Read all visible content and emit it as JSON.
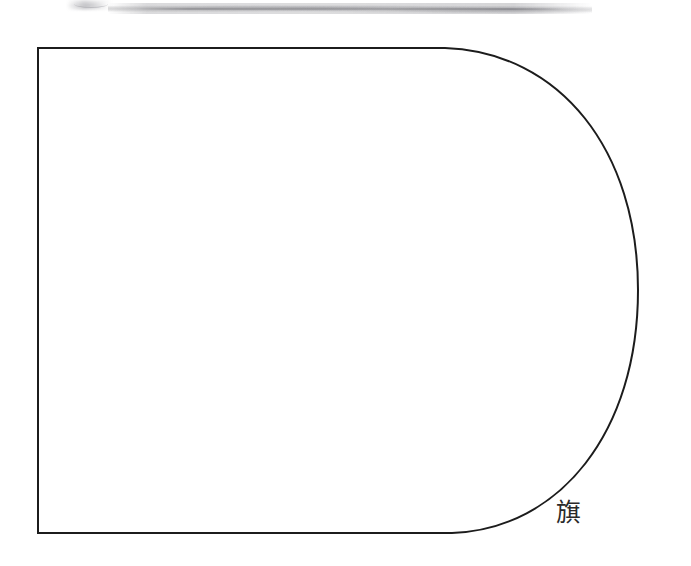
{
  "page": {
    "width": 691,
    "height": 566,
    "background_color": "#ffffff"
  },
  "figure": {
    "name": "d-shape-outline",
    "stroke_color": "#1c1c1c",
    "stroke_width": 2,
    "fill_color": "none",
    "geometry": {
      "left_edge_x": 38,
      "top_edge_y": 48,
      "bottom_edge_y": 533,
      "straight_run_end_x": 445,
      "rightmost_x": 638,
      "curve_center_y": 290
    }
  },
  "caption": {
    "text": "旗",
    "meaning_label": "flag",
    "color": "#2a2a2a",
    "x": 556,
    "y": 500,
    "font_size": 25
  },
  "artifacts": [
    {
      "name": "top-smudge-main",
      "kind": "scan-smudge",
      "x": 108,
      "y": 3,
      "width": 484,
      "height": 11,
      "color": "#808086"
    },
    {
      "name": "top-smudge-left",
      "kind": "scan-smudge",
      "x": 66,
      "y": 0,
      "width": 46,
      "height": 10,
      "color": "#96969c"
    }
  ]
}
